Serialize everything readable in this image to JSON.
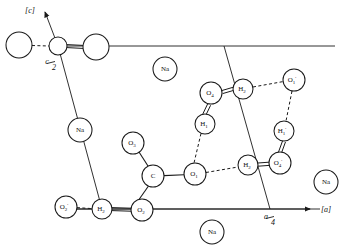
{
  "figure": {
    "background_color": "#ffffff",
    "line_color": "#1a1a1a",
    "width": 341,
    "height": 251
  },
  "axes": {
    "c_axis": {
      "label": "[c]",
      "x": 30,
      "y": 10
    },
    "a_axis": {
      "label": "[a]",
      "x": 326,
      "y": 209
    },
    "c_half_tick": {
      "label": "c/2",
      "numerator": "c",
      "denominator": "2",
      "x": 51,
      "y": 64
    },
    "a_quarter_tick": {
      "label": "a/4",
      "numerator": "a",
      "denominator": "4",
      "x": 270,
      "y": 218
    }
  },
  "atoms": [
    {
      "id": "plain-1",
      "element": "",
      "label": "",
      "x": 19,
      "y": 45,
      "r": 13,
      "kind": "open"
    },
    {
      "id": "plain-2",
      "element": "",
      "label": "",
      "x": 58,
      "y": 46,
      "r": 9,
      "kind": "open"
    },
    {
      "id": "plain-3",
      "element": "",
      "label": "",
      "x": 96,
      "y": 47,
      "r": 13,
      "kind": "open"
    },
    {
      "id": "na-1",
      "element": "Na",
      "label": "Na",
      "sub": "",
      "prime": "",
      "x": 165,
      "y": 69,
      "r": 12,
      "kind": "labeled"
    },
    {
      "id": "na-2",
      "element": "Na",
      "label": "Na",
      "sub": "",
      "prime": "",
      "x": 80,
      "y": 130,
      "r": 12,
      "kind": "labeled"
    },
    {
      "id": "na-3",
      "element": "Na",
      "label": "Na",
      "sub": "",
      "prime": "",
      "x": 326,
      "y": 182,
      "r": 12,
      "kind": "labeled"
    },
    {
      "id": "na-4",
      "element": "Na",
      "label": "Na",
      "sub": "",
      "prime": "",
      "x": 212,
      "y": 232,
      "r": 12,
      "kind": "labeled"
    },
    {
      "id": "o4",
      "element": "O",
      "label": "O",
      "sub": "4",
      "prime": "",
      "x": 211,
      "y": 93,
      "r": 11,
      "kind": "labeled"
    },
    {
      "id": "h2-top",
      "element": "H",
      "label": "H",
      "sub": "2",
      "prime": "",
      "x": 243,
      "y": 89,
      "r": 10,
      "kind": "labeled"
    },
    {
      "id": "o1-prime",
      "element": "O",
      "label": "O",
      "sub": "1",
      "prime": "'",
      "x": 294,
      "y": 80,
      "r": 11,
      "kind": "labeled"
    },
    {
      "id": "h1-mid",
      "element": "H",
      "label": "H",
      "sub": "1",
      "prime": "",
      "x": 205,
      "y": 124,
      "r": 10,
      "kind": "labeled"
    },
    {
      "id": "h1-prime",
      "element": "H",
      "label": "H",
      "sub": "1",
      "prime": "'",
      "x": 284,
      "y": 131,
      "r": 10,
      "kind": "labeled"
    },
    {
      "id": "o3",
      "element": "O",
      "label": "O",
      "sub": "3",
      "prime": "",
      "x": 133,
      "y": 143,
      "r": 11,
      "kind": "labeled"
    },
    {
      "id": "c-atom",
      "element": "C",
      "label": "C",
      "sub": "",
      "prime": "",
      "x": 153,
      "y": 176,
      "r": 11,
      "kind": "labeled"
    },
    {
      "id": "o1",
      "element": "O",
      "label": "O",
      "sub": "1",
      "prime": "",
      "x": 195,
      "y": 174,
      "r": 11,
      "kind": "labeled"
    },
    {
      "id": "h2-mid",
      "element": "H",
      "label": "H",
      "sub": "2",
      "prime": "",
      "x": 248,
      "y": 165,
      "r": 10,
      "kind": "labeled"
    },
    {
      "id": "o4-prime",
      "element": "O",
      "label": "O",
      "sub": "4",
      "prime": "'",
      "x": 280,
      "y": 163,
      "r": 11,
      "kind": "labeled"
    },
    {
      "id": "o2-prime",
      "element": "O",
      "label": "O",
      "sub": "2",
      "prime": "'",
      "x": 66,
      "y": 207,
      "r": 11,
      "kind": "labeled"
    },
    {
      "id": "h2-bot",
      "element": "H",
      "label": "H",
      "sub": "2",
      "prime": "",
      "x": 102,
      "y": 209,
      "r": 10,
      "kind": "labeled"
    },
    {
      "id": "o2",
      "element": "O",
      "label": "O",
      "sub": "2",
      "prime": "",
      "x": 142,
      "y": 210,
      "r": 11,
      "kind": "labeled"
    }
  ],
  "bonds": [
    {
      "from": "plain-1",
      "to": "plain-2",
      "style": "dashed"
    },
    {
      "from": "plain-2",
      "to": "plain-3",
      "style": "double"
    },
    {
      "from": "o4",
      "to": "h2-top",
      "style": "double"
    },
    {
      "from": "h2-top",
      "to": "o1-prime",
      "style": "dashed"
    },
    {
      "from": "o4",
      "to": "h1-mid",
      "style": "double"
    },
    {
      "from": "h1-mid",
      "to": "o1",
      "style": "dashed"
    },
    {
      "from": "o1-prime",
      "to": "h1-prime",
      "style": "dashed"
    },
    {
      "from": "h1-prime",
      "to": "o4-prime",
      "style": "double"
    },
    {
      "from": "o1",
      "to": "h2-mid",
      "style": "dashed"
    },
    {
      "from": "h2-mid",
      "to": "o4-prime",
      "style": "double"
    },
    {
      "from": "o3",
      "to": "c-atom",
      "style": "solid"
    },
    {
      "from": "c-atom",
      "to": "o1",
      "style": "solid"
    },
    {
      "from": "c-atom",
      "to": "o2",
      "style": "solid"
    },
    {
      "from": "o2-prime",
      "to": "h2-bot",
      "style": "dashed"
    },
    {
      "from": "h2-bot",
      "to": "o2",
      "style": "double"
    }
  ],
  "cell_edges": [
    {
      "name": "top-edge",
      "x1": 58,
      "y1": 46,
      "x2": 335,
      "y2": 46
    },
    {
      "name": "left-edge",
      "x1": 58,
      "y1": 46,
      "x2": 102,
      "y2": 209
    },
    {
      "name": "bottom-edge",
      "x1": 58,
      "y1": 209,
      "x2": 320,
      "y2": 209
    },
    {
      "name": "slant-edge",
      "x1": 224,
      "y1": 46,
      "x2": 270,
      "y2": 209
    }
  ]
}
